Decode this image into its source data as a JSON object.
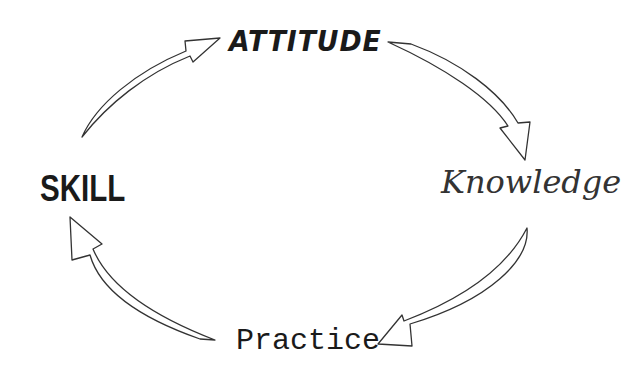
{
  "diagram": {
    "type": "cycle",
    "nodes": [
      {
        "id": "attitude",
        "label": "ATTITUDE"
      },
      {
        "id": "knowledge",
        "label": "Knowledge"
      },
      {
        "id": "practice",
        "label": "Practice"
      },
      {
        "id": "skill",
        "label": "SKILL"
      }
    ],
    "edges": [
      {
        "from": "skill",
        "to": "attitude"
      },
      {
        "from": "attitude",
        "to": "knowledge"
      },
      {
        "from": "knowledge",
        "to": "practice"
      },
      {
        "from": "practice",
        "to": "skill"
      }
    ],
    "colors": {
      "text": "#1a1a1a",
      "arrow_stroke": "#333333",
      "background": "#ffffff"
    }
  }
}
